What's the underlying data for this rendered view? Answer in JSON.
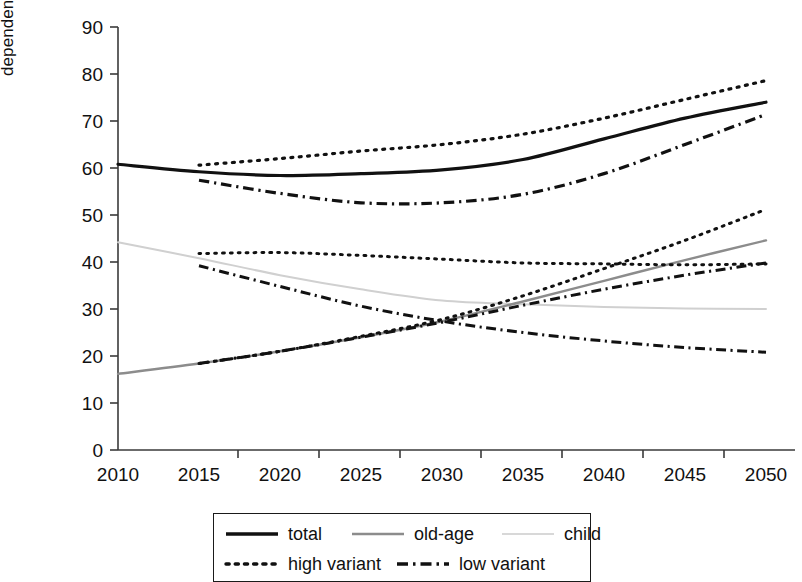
{
  "chart_data": {
    "type": "line",
    "title": "",
    "xlabel": "",
    "ylabel": "dependency ratio",
    "x": [
      2010,
      2015,
      2020,
      2025,
      2030,
      2035,
      2040,
      2045,
      2050
    ],
    "xlim": [
      2010,
      2050
    ],
    "ylim": [
      0,
      90
    ],
    "ytick_labels": [
      "0",
      "10",
      "20",
      "30",
      "40",
      "50",
      "60",
      "70",
      "80",
      "90"
    ],
    "xtick_labels": [
      "2010",
      "2015",
      "2020",
      "2025",
      "2030",
      "2035",
      "2040",
      "2045",
      "2050"
    ],
    "grid": false,
    "legend_position": "bottom",
    "series": [
      {
        "name": "total",
        "style": "solid",
        "color": "#111111",
        "width": 3.2,
        "x": [
          2010,
          2015,
          2020,
          2025,
          2030,
          2035,
          2040,
          2045,
          2050
        ],
        "values": [
          60.8,
          59.2,
          58.4,
          58.8,
          59.6,
          61.8,
          66.2,
          70.6,
          74.0
        ]
      },
      {
        "name": "old-age",
        "style": "solid",
        "color": "#8c8c8c",
        "width": 2.4,
        "x": [
          2010,
          2015,
          2020,
          2025,
          2030,
          2035,
          2040,
          2045,
          2050
        ],
        "values": [
          16.2,
          18.4,
          21.0,
          24.0,
          27.4,
          31.6,
          36.0,
          40.4,
          44.6
        ]
      },
      {
        "name": "child",
        "style": "solid",
        "color": "#d0d0d0",
        "width": 2.0,
        "x": [
          2010,
          2015,
          2020,
          2025,
          2030,
          2035,
          2040,
          2045,
          2050
        ],
        "values": [
          44.2,
          40.8,
          37.2,
          34.2,
          31.8,
          31.0,
          30.4,
          30.1,
          30.0
        ]
      },
      {
        "name": "high variant",
        "style": "dotted",
        "color": "#111111",
        "width": 3.2,
        "group": "total",
        "x": [
          2015,
          2020,
          2025,
          2030,
          2035,
          2040,
          2045,
          2050
        ],
        "values": [
          60.6,
          62.0,
          63.6,
          65.0,
          67.2,
          70.6,
          74.6,
          78.6
        ]
      },
      {
        "name": "low variant",
        "style": "dashdot",
        "color": "#111111",
        "width": 3.2,
        "group": "total",
        "x": [
          2015,
          2020,
          2025,
          2030,
          2035,
          2040,
          2045,
          2050
        ],
        "values": [
          57.4,
          54.6,
          52.6,
          52.6,
          54.4,
          58.8,
          65.0,
          71.4
        ]
      },
      {
        "name": "high variant",
        "style": "dotted",
        "color": "#111111",
        "width": 3.0,
        "group": "old-age",
        "x": [
          2015,
          2020,
          2025,
          2030,
          2035,
          2040,
          2045,
          2050
        ],
        "values": [
          18.4,
          21.0,
          24.2,
          27.8,
          32.8,
          38.6,
          44.6,
          51.2
        ]
      },
      {
        "name": "low variant",
        "style": "dashdot",
        "color": "#111111",
        "width": 3.0,
        "group": "old-age",
        "x": [
          2015,
          2020,
          2025,
          2030,
          2035,
          2040,
          2045,
          2050
        ],
        "values": [
          18.4,
          21.0,
          24.0,
          27.2,
          30.8,
          34.2,
          37.2,
          39.8
        ]
      },
      {
        "name": "high variant",
        "style": "dotted",
        "color": "#111111",
        "width": 3.0,
        "group": "child",
        "x": [
          2015,
          2020,
          2025,
          2030,
          2035,
          2040,
          2045,
          2050
        ],
        "values": [
          41.8,
          42.0,
          41.4,
          40.6,
          39.8,
          39.6,
          39.4,
          39.6
        ]
      },
      {
        "name": "low variant",
        "style": "dashdot",
        "color": "#111111",
        "width": 3.0,
        "group": "child",
        "x": [
          2015,
          2020,
          2025,
          2030,
          2035,
          2040,
          2045,
          2050
        ],
        "values": [
          39.2,
          34.8,
          30.6,
          27.4,
          25.0,
          23.2,
          21.8,
          20.8
        ]
      }
    ]
  },
  "axis": {
    "ylabel": "dependency ratio"
  },
  "legend": {
    "rows": [
      [
        {
          "label": "total",
          "style": "solid",
          "color": "#111111",
          "width": 3.4
        },
        {
          "label": "old-age",
          "style": "solid",
          "color": "#8c8c8c",
          "width": 2.6
        },
        {
          "label": "child",
          "style": "solid",
          "color": "#d8d8d8",
          "width": 2.2
        }
      ],
      [
        {
          "label": "high variant",
          "style": "dotted",
          "color": "#111111",
          "width": 3.4
        },
        {
          "label": "low variant",
          "style": "dashdot",
          "color": "#111111",
          "width": 3.4
        }
      ]
    ]
  }
}
